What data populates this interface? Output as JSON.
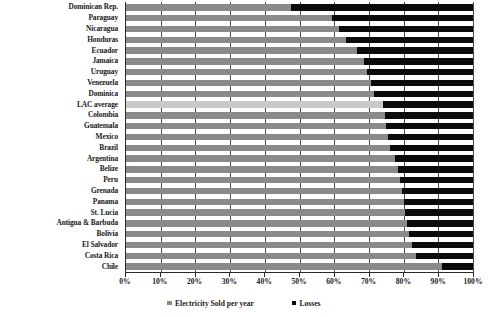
{
  "chart_data": {
    "type": "bar",
    "orientation": "horizontal",
    "stacked": true,
    "title": "",
    "subtitle": "",
    "xlabel": "",
    "ylabel": "",
    "xlim": [
      0,
      100
    ],
    "grid": true,
    "legend_position": "bottom",
    "tick_labels": [
      "0%",
      "10%",
      "20%",
      "30%",
      "40%",
      "50%",
      "60%",
      "70%",
      "80%",
      "90%",
      "100%"
    ],
    "tick_values": [
      0,
      10,
      20,
      30,
      40,
      50,
      60,
      70,
      80,
      90,
      100
    ],
    "categories": [
      "Dominican Rep.",
      "Paraguay",
      "Nicaragua",
      "Honduras",
      "Ecuador",
      "Jamaica",
      "Uruguay",
      "Venezuela",
      "Dominica",
      "LAC average",
      "Colombia",
      "Guatemala",
      "Mexico",
      "Brazil",
      "Argentina",
      "Belize",
      "Peru",
      "Grenada",
      "Panama",
      "St. Lucia",
      "Antigua & Barbuda",
      "Bolivia",
      "El Salvador",
      "Costa Rica",
      "Chile"
    ],
    "series": [
      {
        "name": "Electricity Sold per year",
        "color": "#8a8a8a",
        "values": [
          47.5,
          59.5,
          61.5,
          63.5,
          66.5,
          68.5,
          69.5,
          70.5,
          71.5,
          74.0,
          74.5,
          75.0,
          75.5,
          76.0,
          77.5,
          78.5,
          79.0,
          79.5,
          80.0,
          80.5,
          81.0,
          81.5,
          82.5,
          83.5,
          91.0
        ]
      },
      {
        "name": "Losses",
        "color": "#0b0b0b",
        "values": [
          52.5,
          40.5,
          38.5,
          36.5,
          33.5,
          31.5,
          30.5,
          29.5,
          28.5,
          26.0,
          25.5,
          25.0,
          24.5,
          24.0,
          22.5,
          21.5,
          21.0,
          20.5,
          20.0,
          19.5,
          19.0,
          18.5,
          17.5,
          16.5,
          9.0
        ]
      }
    ],
    "highlight_category": "LAC average",
    "highlight_color": "#c9c9c9"
  },
  "legend": {
    "items": [
      {
        "label": "Electricity Sold per year",
        "swatch": "sold"
      },
      {
        "label": "Losses",
        "swatch": "loss"
      }
    ]
  }
}
